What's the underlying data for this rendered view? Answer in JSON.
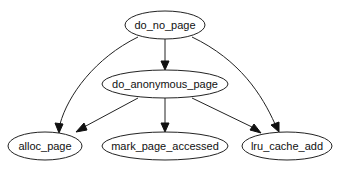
{
  "diagram": {
    "type": "call-graph",
    "nodes": [
      {
        "id": "do_no_page",
        "label": "do_no_page"
      },
      {
        "id": "do_anonymous_page",
        "label": "do_anonymous_page"
      },
      {
        "id": "alloc_page",
        "label": "alloc_page"
      },
      {
        "id": "mark_page_accessed",
        "label": "mark_page_accessed"
      },
      {
        "id": "lru_cache_add",
        "label": "lru_cache_add"
      }
    ],
    "edges": [
      {
        "from": "do_no_page",
        "to": "alloc_page"
      },
      {
        "from": "do_no_page",
        "to": "do_anonymous_page"
      },
      {
        "from": "do_no_page",
        "to": "lru_cache_add"
      },
      {
        "from": "do_anonymous_page",
        "to": "alloc_page"
      },
      {
        "from": "do_anonymous_page",
        "to": "mark_page_accessed"
      },
      {
        "from": "do_anonymous_page",
        "to": "lru_cache_add"
      }
    ]
  }
}
